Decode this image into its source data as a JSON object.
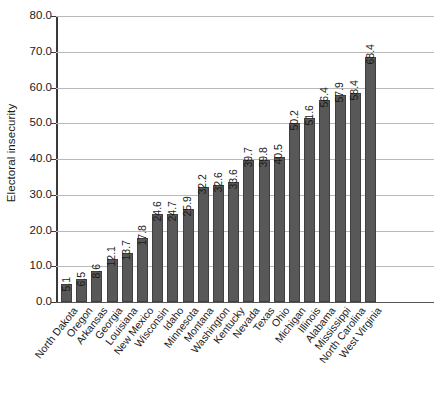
{
  "chart_data": {
    "type": "bar",
    "title": "",
    "xlabel": "",
    "ylabel": "Electoral insecurity",
    "ylim": [
      0,
      80
    ],
    "ytick_step": 10,
    "ytick_labels": [
      "0.0",
      "10.0",
      "20.0",
      "30.0",
      "40.0",
      "50.0",
      "60.0",
      "70.0",
      "80.0"
    ],
    "grid": true,
    "legend": "none",
    "orientation": "vertical",
    "value_labels_shown": true,
    "value_label_rotation_deg": 90,
    "xtick_label_rotation_deg": 52,
    "bar_color": "#585858",
    "gridline_color": "#b9b9b9",
    "axis_color": "#3a3a3a",
    "text_color": "#1a1a1a",
    "background_color": "#ffffff",
    "categories": [
      "North Dakota",
      "Oregon",
      "Arkansas",
      "Georgia",
      "Louisiana",
      "New Mexico",
      "Wisconsin",
      "Idaho",
      "Minnesota",
      "Montana",
      "Washington",
      "Kentucky",
      "Nevada",
      "Texas",
      "Ohio",
      "Michigan",
      "Illinois",
      "Alabama",
      "Mississippi",
      "North Carolina",
      "West Virginia"
    ],
    "values": [
      5.1,
      6.5,
      8.6,
      12.1,
      13.7,
      17.8,
      24.6,
      24.7,
      25.9,
      32.2,
      32.6,
      33.6,
      39.7,
      39.8,
      40.5,
      50.2,
      51.6,
      56.4,
      57.9,
      58.4,
      68.4
    ],
    "value_labels": [
      "5.1",
      "6.5",
      "8.6",
      "12.1",
      "13.7",
      "17.8",
      "24.6",
      "24.7",
      "25.9",
      "32.2",
      "32.6",
      "33.6",
      "39.7",
      "39.8",
      "40.5",
      "50.2",
      "51.6",
      "56.4",
      "57.9",
      "58.4",
      "68.4"
    ]
  }
}
